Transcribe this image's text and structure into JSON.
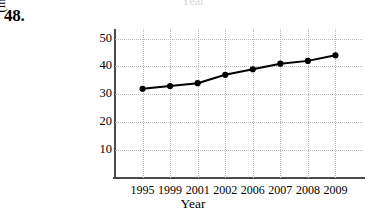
{
  "exercise": {
    "number": "48."
  },
  "top_remnant": {
    "text": "Year"
  },
  "chart_data": {
    "type": "line",
    "title": "",
    "xlabel": "Year",
    "ylabel": "Cost of first-class postage (in cents)",
    "ylabel_line1": "Cost of first-class postage",
    "ylabel_line2": "(in cents)",
    "categories": [
      "1995",
      "1999",
      "2001",
      "2002",
      "2006",
      "2007",
      "2008",
      "2009"
    ],
    "values": [
      32,
      33,
      34,
      37,
      39,
      41,
      42,
      44
    ],
    "yticks": [
      "10",
      "20",
      "30",
      "40",
      "50"
    ],
    "ytick_values": [
      10,
      20,
      30,
      40,
      50
    ],
    "ylim": [
      0,
      52
    ],
    "xlim": [
      0,
      9
    ],
    "grid": true,
    "legend": "none",
    "marker": "filled-circle",
    "line_color": "#000000",
    "grid_color": "#b9b9b9",
    "axis_color": "#4a4a4a"
  }
}
